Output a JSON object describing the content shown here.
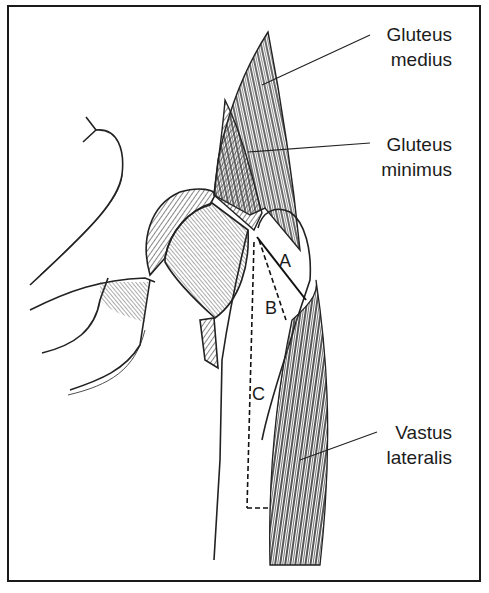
{
  "figure": {
    "labels": [
      {
        "id": "gluteus-medius",
        "line1": "Gluteus",
        "line2": "medius"
      },
      {
        "id": "gluteus-minimus",
        "line1": "Gluteus",
        "line2": "minimus"
      },
      {
        "id": "vastus-lateralis",
        "line1": "Vastus",
        "line2": "lateralis"
      }
    ],
    "zones": [
      "A",
      "B",
      "C"
    ],
    "colors": {
      "ink": "#1c1c1c",
      "background": "#ffffff"
    }
  }
}
